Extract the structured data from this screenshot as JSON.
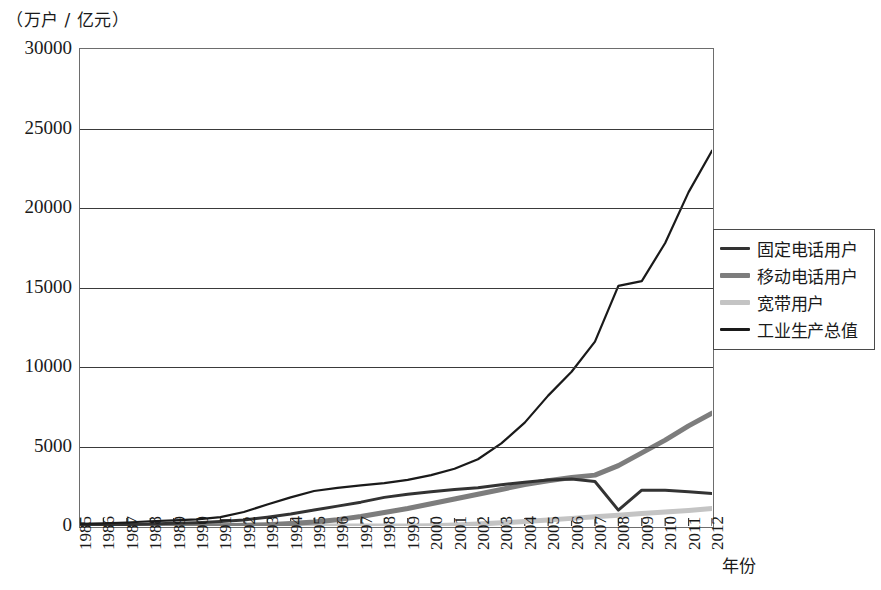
{
  "chart_data": {
    "type": "line",
    "title": "",
    "ylabel": "（万户 / 亿元）",
    "xlabel": "年份",
    "ylim": [
      0,
      30000
    ],
    "yticks": [
      "0",
      "5000",
      "10000",
      "15000",
      "20000",
      "25000",
      "30000"
    ],
    "ytick_values": [
      0,
      5000,
      10000,
      15000,
      20000,
      25000,
      30000
    ],
    "grid": "horizontal",
    "legend_position": "right",
    "categories": [
      "1985",
      "1986",
      "1987",
      "1988",
      "1989",
      "1990",
      "1991",
      "1992",
      "1993",
      "1994",
      "1995",
      "1996",
      "1997",
      "1998",
      "1999",
      "2000",
      "2001",
      "2002",
      "2003",
      "2004",
      "2005",
      "2006",
      "2007",
      "2008",
      "2009",
      "2010",
      "2011",
      "2012"
    ],
    "series": [
      {
        "name": "固定电话用户",
        "color": "#333333",
        "width": 3.0,
        "values": [
          70,
          85,
          100,
          130,
          170,
          210,
          280,
          380,
          550,
          750,
          1000,
          1250,
          1500,
          1800,
          2000,
          2150,
          2300,
          2400,
          2600,
          2750,
          2900,
          2950,
          2800,
          1000,
          2250,
          2250,
          2150,
          2050
        ]
      },
      {
        "name": "移动电话用户",
        "color": "#7d7d7d",
        "width": 5.0,
        "values": [
          0,
          0,
          0,
          2,
          5,
          10,
          20,
          40,
          80,
          150,
          250,
          400,
          600,
          850,
          1100,
          1400,
          1700,
          2000,
          2300,
          2600,
          2850,
          3050,
          3200,
          3800,
          4600,
          5400,
          6300,
          7100
        ]
      },
      {
        "name": "宽带用户",
        "color": "#c4c4c4",
        "width": 5.0,
        "values": [
          0,
          0,
          0,
          0,
          0,
          0,
          0,
          0,
          0,
          0,
          0,
          0,
          0,
          0,
          5,
          20,
          60,
          120,
          200,
          280,
          380,
          480,
          580,
          680,
          780,
          880,
          980,
          1100
        ]
      },
      {
        "name": "工业生产总值",
        "color": "#1a1a1a",
        "width": 2.2,
        "values": [
          130,
          170,
          220,
          300,
          360,
          420,
          560,
          880,
          1350,
          1800,
          2200,
          2400,
          2550,
          2700,
          2900,
          3200,
          3600,
          4200,
          5200,
          6500,
          8200,
          9700,
          11600,
          15100,
          15400,
          17800,
          21000,
          23600
        ]
      }
    ]
  },
  "legend": {
    "items": [
      {
        "label": "固定电话用户",
        "swatch": "line-dark-thin"
      },
      {
        "label": "移动电话用户",
        "swatch": "line-gray-thick"
      },
      {
        "label": "宽带用户",
        "swatch": "line-lightgray-thick"
      },
      {
        "label": "工业生产总值",
        "swatch": "line-black-thin"
      }
    ]
  }
}
